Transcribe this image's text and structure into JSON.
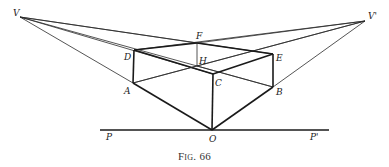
{
  "figure": {
    "caption": "Fig. 66",
    "labels": {
      "V": "V",
      "V_prime": "V'",
      "F": "F",
      "D": "D",
      "E": "E",
      "H": "H",
      "C": "C",
      "A": "A",
      "B": "B",
      "O": "O",
      "P": "P",
      "P_prime": "P'"
    }
  }
}
